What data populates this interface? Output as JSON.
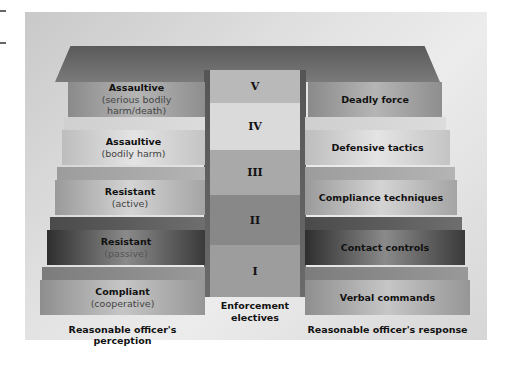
{
  "diagram": {
    "left_column_label": "Reasonable officer's perception",
    "center_column_label": "Enforcement electives",
    "right_column_label": "Reasonable officer's response",
    "levels": [
      {
        "numeral": "V",
        "perception_title": "Assaultive",
        "perception_sub": "(serious bodily harm/death)",
        "response": "Deadly force"
      },
      {
        "numeral": "IV",
        "perception_title": "Assaultive",
        "perception_sub": "(bodily harm)",
        "response": "Defensive tactics"
      },
      {
        "numeral": "III",
        "perception_title": "Resistant",
        "perception_sub": "(active)",
        "response": "Compliance techniques"
      },
      {
        "numeral": "II",
        "perception_title": "Resistant",
        "perception_sub": "(passive)",
        "response": "Contact controls"
      },
      {
        "numeral": "I",
        "perception_title": "Compliant",
        "perception_sub": "(cooperative)",
        "response": "Verbal commands"
      }
    ]
  },
  "colors": {
    "background": "#ffffff",
    "panel": "#e0e0e0",
    "top_slab": "#666666",
    "dark_step": "#333333",
    "text": "#111111"
  }
}
